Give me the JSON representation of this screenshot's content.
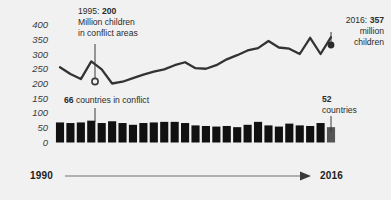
{
  "figure": {
    "background_color": "#f1f1f1",
    "line_color": "#333333",
    "bar_color": "#111111",
    "bar_highlight_color": "#555555",
    "axis_color": "#8a8a8a"
  },
  "y_axis": {
    "ticks": [
      "400",
      "350",
      "300",
      "250",
      "200",
      "150",
      "100",
      "50",
      "0"
    ]
  },
  "x_axis": {
    "start_label": "1990",
    "end_label": "2016"
  },
  "annotations": {
    "line_start": {
      "line1_prefix": "1995: ",
      "line1_value": "200",
      "line2": "Million children",
      "line3": "in conflict areas"
    },
    "line_end": {
      "line1_prefix": "2016: ",
      "line1_value": "357",
      "line2": "million",
      "line3": "children"
    },
    "bar_mid": {
      "value": "66",
      "text": " countries in conflict"
    },
    "bar_end": {
      "value": "52",
      "text": "countries"
    }
  },
  "chart_data": [
    {
      "type": "line",
      "title": "Million children in conflict areas",
      "xlabel": "",
      "ylabel": "Million children",
      "ylim": [
        0,
        400
      ],
      "grid": false,
      "legend": "none",
      "x": [
        1990,
        1991,
        1992,
        1993,
        1994,
        1995,
        1996,
        1997,
        1998,
        1999,
        2000,
        2001,
        2002,
        2003,
        2004,
        2005,
        2006,
        2007,
        2008,
        2009,
        2010,
        2011,
        2012,
        2013,
        2014,
        2015,
        2016
      ],
      "series": [
        {
          "name": "Children in conflict areas (millions)",
          "values": [
            255,
            232,
            215,
            275,
            248,
            200,
            206,
            218,
            230,
            240,
            248,
            262,
            272,
            252,
            250,
            262,
            282,
            296,
            312,
            320,
            344,
            322,
            318,
            300,
            355,
            300,
            357
          ]
        }
      ],
      "annotations": [
        {
          "x": 1995,
          "y": 200,
          "text": "1995: 200 Million children in conflict areas"
        },
        {
          "x": 2016,
          "y": 357,
          "text": "2016: 357 million children"
        }
      ]
    },
    {
      "type": "bar",
      "title": "Countries in conflict",
      "xlabel": "",
      "ylabel": "Countries",
      "ylim": [
        0,
        400
      ],
      "grid": false,
      "legend": "none",
      "categories": [
        1990,
        1991,
        1992,
        1993,
        1994,
        1995,
        1996,
        1997,
        1998,
        1999,
        2000,
        2001,
        2002,
        2003,
        2004,
        2005,
        2006,
        2007,
        2008,
        2009,
        2010,
        2011,
        2012,
        2013,
        2014,
        2015,
        2016
      ],
      "values": [
        68,
        66,
        68,
        74,
        66,
        72,
        66,
        60,
        66,
        68,
        70,
        70,
        66,
        58,
        56,
        54,
        56,
        52,
        60,
        70,
        58,
        54,
        64,
        58,
        56,
        66,
        52
      ],
      "highlight_index": 26,
      "annotations": [
        {
          "x": 1995,
          "y": 72,
          "text": "66 countries in conflict"
        },
        {
          "x": 2016,
          "y": 52,
          "text": "52 countries"
        }
      ]
    }
  ]
}
